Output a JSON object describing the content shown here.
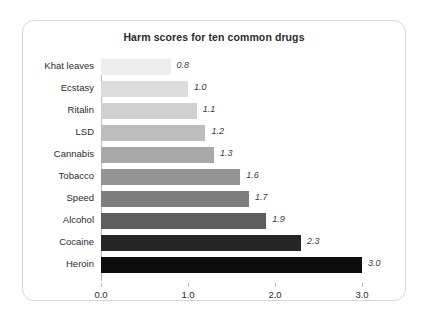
{
  "card": {
    "border_color": "#d6d6d6",
    "background": "#ffffff"
  },
  "chart_data": {
    "type": "bar",
    "orientation": "horizontal",
    "title": "Harm scores for ten common drugs",
    "xlabel": "",
    "ylabel": "",
    "xlim": [
      0.0,
      3.0
    ],
    "grid": false,
    "legend": null,
    "categories": [
      "Khat leaves",
      "Ecstasy",
      "Ritalin",
      "LSD",
      "Cannabis",
      "Tobacco",
      "Speed",
      "Alcohol",
      "Cocaine",
      "Heroin"
    ],
    "values": [
      0.8,
      1.0,
      1.1,
      1.2,
      1.3,
      1.6,
      1.7,
      1.9,
      2.3,
      3.0
    ],
    "value_labels": [
      "0.8",
      "1.0",
      "1.1",
      "1.2",
      "1.3",
      "1.6",
      "1.7",
      "1.9",
      "2.3",
      "3.0"
    ],
    "bar_colors": [
      "#ededed",
      "#dcdcdc",
      "#d0d0d0",
      "#bdbdbd",
      "#a8a8a8",
      "#949494",
      "#7d7d7d",
      "#5e5e5e",
      "#262626",
      "#0d0d0d"
    ],
    "xticks": [
      0.0,
      1.0,
      2.0,
      3.0
    ],
    "xtick_labels": [
      "0.0",
      "1.0",
      "2.0",
      "3.0"
    ],
    "axis_color": "#bdbdbd"
  }
}
